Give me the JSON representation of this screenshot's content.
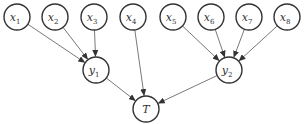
{
  "diagram": {
    "type": "tree",
    "nodes": [
      {
        "id": "x1",
        "base": "x",
        "sub": "1",
        "cx": 17,
        "cy": 17,
        "r": 13
      },
      {
        "id": "x2",
        "base": "x",
        "sub": "2",
        "cx": 55,
        "cy": 17,
        "r": 13
      },
      {
        "id": "x3",
        "base": "x",
        "sub": "3",
        "cx": 94,
        "cy": 17,
        "r": 13
      },
      {
        "id": "x4",
        "base": "x",
        "sub": "4",
        "cx": 133,
        "cy": 17,
        "r": 13
      },
      {
        "id": "x5",
        "base": "x",
        "sub": "5",
        "cx": 173,
        "cy": 17,
        "r": 13
      },
      {
        "id": "x6",
        "base": "x",
        "sub": "6",
        "cx": 211,
        "cy": 17,
        "r": 13
      },
      {
        "id": "x7",
        "base": "x",
        "sub": "7",
        "cx": 249,
        "cy": 17,
        "r": 13
      },
      {
        "id": "x8",
        "base": "x",
        "sub": "8",
        "cx": 287,
        "cy": 17,
        "r": 13
      },
      {
        "id": "y1",
        "base": "y",
        "sub": "1",
        "cx": 96,
        "cy": 70,
        "r": 13
      },
      {
        "id": "y2",
        "base": "y",
        "sub": "2",
        "cx": 229,
        "cy": 70,
        "r": 13
      },
      {
        "id": "T",
        "base": "T",
        "sub": "",
        "cx": 146,
        "cy": 109,
        "r": 13
      }
    ],
    "edges": [
      {
        "from": "x1",
        "to": "y1"
      },
      {
        "from": "x2",
        "to": "y1"
      },
      {
        "from": "x3",
        "to": "y1"
      },
      {
        "from": "x4",
        "to": "T"
      },
      {
        "from": "x5",
        "to": "y2"
      },
      {
        "from": "x6",
        "to": "y2"
      },
      {
        "from": "x7",
        "to": "y2"
      },
      {
        "from": "x8",
        "to": "y2"
      },
      {
        "from": "y1",
        "to": "T"
      },
      {
        "from": "y2",
        "to": "T"
      }
    ]
  }
}
